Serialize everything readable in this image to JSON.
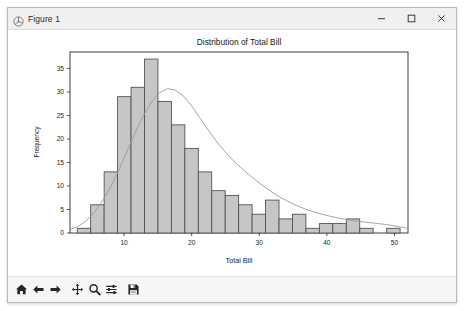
{
  "window": {
    "title": "Figure 1",
    "icon": "matplotlib-icon",
    "controls": [
      {
        "name": "minimize-button",
        "glyph": "minimize-icon"
      },
      {
        "name": "maximize-button",
        "glyph": "maximize-icon"
      },
      {
        "name": "close-button",
        "glyph": "close-icon"
      }
    ]
  },
  "toolbar": {
    "buttons": [
      {
        "name": "home-button",
        "icon": "home-icon",
        "tooltip": "Reset original view"
      },
      {
        "name": "back-button",
        "icon": "arrow-left-icon",
        "tooltip": "Back to previous view"
      },
      {
        "name": "forward-button",
        "icon": "arrow-right-icon",
        "tooltip": "Forward to next view"
      },
      {
        "name": "pan-button",
        "icon": "move-cross-icon",
        "tooltip": "Pan axes with left mouse, zoom with right"
      },
      {
        "name": "zoom-button",
        "icon": "magnifier-icon",
        "tooltip": "Zoom to rectangle"
      },
      {
        "name": "subplots-button",
        "icon": "sliders-icon",
        "tooltip": "Configure subplots"
      },
      {
        "name": "save-button",
        "icon": "floppy-disk-icon",
        "tooltip": "Save the figure"
      }
    ]
  },
  "colors": {
    "bar_face": "#c6c6c6",
    "bar_edge": "#4d4d4d",
    "kde_line": "#9a9a9a",
    "axes_edge": "#2b2b2b",
    "text": "#1a1a1a",
    "figure_bg": "#ffffff",
    "titlebar_bg": "#f0f0f0",
    "toolbar_bg": "#f6f6f6"
  },
  "chart_data": {
    "type": "bar",
    "title": "Distribution of Total Bill",
    "xlabel": "Total Bill",
    "ylabel": "Frequency",
    "xlim": [
      2.0,
      52.0
    ],
    "ylim": [
      0,
      38.5
    ],
    "xticks": [
      10,
      20,
      30,
      40,
      50
    ],
    "xticklabels": [
      "10",
      "20",
      "30",
      "40",
      "50"
    ],
    "yticks": [
      0,
      5,
      10,
      15,
      20,
      25,
      30,
      35
    ],
    "yticklabels": [
      "0",
      "5",
      "10",
      "15",
      "20",
      "25",
      "30",
      "35"
    ],
    "grid": false,
    "legend": null,
    "bin_edges": [
      3.07,
      5.06,
      7.05,
      9.04,
      11.03,
      13.02,
      15.01,
      17.0,
      18.99,
      20.98,
      22.97,
      24.96,
      26.95,
      28.94,
      30.93,
      32.92,
      34.91,
      36.9,
      38.89,
      40.88,
      42.87,
      44.86,
      46.85,
      48.84,
      50.83
    ],
    "bin_centers": [
      4.07,
      6.05,
      8.04,
      10.03,
      12.02,
      14.01,
      16.0,
      17.99,
      19.98,
      21.97,
      23.96,
      25.95,
      27.94,
      29.93,
      31.92,
      33.91,
      35.9,
      37.89,
      39.88,
      41.87,
      43.86,
      45.85,
      47.84,
      49.83
    ],
    "values": [
      1,
      6,
      13,
      29,
      31,
      37,
      28,
      23,
      18,
      13,
      9,
      8,
      6,
      4,
      7,
      3,
      4,
      1,
      2,
      2,
      3,
      1,
      0,
      1
    ],
    "kde": {
      "label": "kde-curve",
      "x": [
        2.0,
        3.2,
        4.4,
        5.6,
        6.8,
        8.0,
        9.2,
        10.4,
        11.6,
        12.8,
        14.0,
        15.2,
        16.4,
        17.6,
        18.8,
        20.0,
        21.2,
        22.4,
        23.6,
        24.8,
        26.0,
        27.2,
        28.4,
        29.6,
        30.8,
        32.0,
        33.2,
        34.4,
        35.6,
        36.8,
        38.0,
        39.2,
        40.4,
        41.6,
        42.8,
        44.0,
        45.2,
        46.4,
        47.6,
        48.8,
        50.0,
        51.2,
        52.0
      ],
      "y": [
        0.7,
        1.4,
        2.6,
        4.4,
        6.8,
        9.8,
        13.3,
        17.2,
        21.2,
        24.8,
        27.8,
        29.8,
        30.7,
        30.4,
        29.1,
        27.0,
        24.5,
        22.0,
        19.6,
        17.5,
        15.6,
        14.0,
        12.5,
        11.1,
        9.8,
        8.6,
        7.5,
        6.6,
        5.8,
        5.1,
        4.5,
        4.0,
        3.6,
        3.2,
        2.9,
        2.6,
        2.4,
        2.2,
        2.0,
        1.8,
        1.5,
        1.2,
        1.0
      ]
    }
  }
}
